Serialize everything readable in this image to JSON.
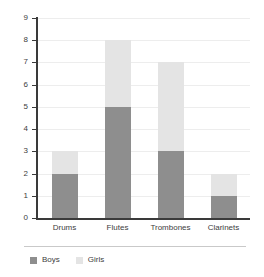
{
  "chart_data": {
    "type": "bar",
    "subtype": "stacked-vertical",
    "title": "",
    "subtitle": "",
    "xlabel": "",
    "ylabel": "",
    "categories": [
      "Drums",
      "Flutes",
      "Trombones",
      "Clarinets"
    ],
    "series": [
      {
        "name": "Boys",
        "color": "#8e8e8e",
        "values": [
          2,
          5,
          3,
          1
        ]
      },
      {
        "name": "Girls",
        "color": "#e4e4e4",
        "values": [
          1,
          3,
          4,
          1
        ]
      }
    ],
    "totals": [
      3,
      8,
      7,
      2
    ],
    "ylim": [
      0,
      9
    ],
    "ytick_labels": [
      "0",
      "1",
      "2",
      "3",
      "4",
      "5",
      "6",
      "7",
      "8",
      "9"
    ],
    "ytick_values": [
      0,
      1,
      2,
      3,
      4,
      5,
      6,
      7,
      8,
      9
    ],
    "grid": {
      "horizontal": true,
      "vertical": false,
      "color": "#ededed"
    },
    "legend": {
      "position": "bottom-left",
      "entries": [
        {
          "label": "Boys",
          "color": "#8e8e8e"
        },
        {
          "label": "Girls",
          "color": "#e4e4e4"
        }
      ]
    },
    "axis_color": "#3a3a3a",
    "background": "#ffffff"
  }
}
